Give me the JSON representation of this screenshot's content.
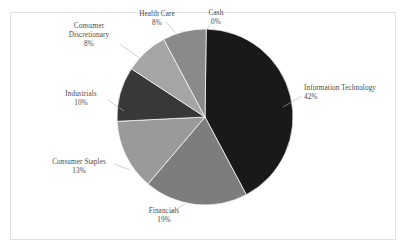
{
  "chart_data": {
    "type": "pie",
    "title": "",
    "subtitle": "",
    "xlabel": "",
    "ylabel": "",
    "legend_position": "none",
    "grid": false,
    "labels_show_percent": true,
    "categories": [
      "Information Technology",
      "Financials",
      "Consumer Staples",
      "Industrials",
      "Consumer Discretionary",
      "Health Care",
      "Cash"
    ],
    "values": [
      42,
      19,
      13,
      10,
      8,
      8,
      0
    ],
    "value_labels": [
      "42%",
      "19%",
      "13%",
      "10%",
      "8%",
      "8%",
      "0%"
    ],
    "colors": [
      "#191919",
      "#7d7d7d",
      "#9a9a9a",
      "#383838",
      "#a5a5a5",
      "#8a8a8a",
      "#cfcfcf"
    ],
    "slices": [
      {
        "name": "Information Technology",
        "name_line1": "Information Technology",
        "name_line2": "",
        "value": 42,
        "percent_label": "42%",
        "color": "#191919"
      },
      {
        "name": "Financials",
        "name_line1": "Financials",
        "name_line2": "",
        "value": 19,
        "percent_label": "19%",
        "color": "#7d7d7d"
      },
      {
        "name": "Consumer Staples",
        "name_line1": "Consumer Staples",
        "name_line2": "",
        "value": 13,
        "percent_label": "13%",
        "color": "#9a9a9a"
      },
      {
        "name": "Industrials",
        "name_line1": "Industrials",
        "name_line2": "",
        "value": 10,
        "percent_label": "10%",
        "color": "#383838"
      },
      {
        "name": "Consumer Discretionary",
        "name_line1": "Consumer",
        "name_line2": "Discretionary",
        "value": 8,
        "percent_label": "8%",
        "color": "#a5a5a5"
      },
      {
        "name": "Health Care",
        "name_line1": "Health Care",
        "name_line2": "",
        "value": 8,
        "percent_label": "8%",
        "color": "#8a8a8a"
      },
      {
        "name": "Cash",
        "name_line1": "Cash",
        "name_line2": "",
        "value": 0,
        "percent_label": "0%",
        "color": "#cfcfcf"
      }
    ]
  },
  "frame": {
    "border_color": "#e2e2e2",
    "background_color": "#ffffff",
    "label_color": "#4a4a4a"
  }
}
